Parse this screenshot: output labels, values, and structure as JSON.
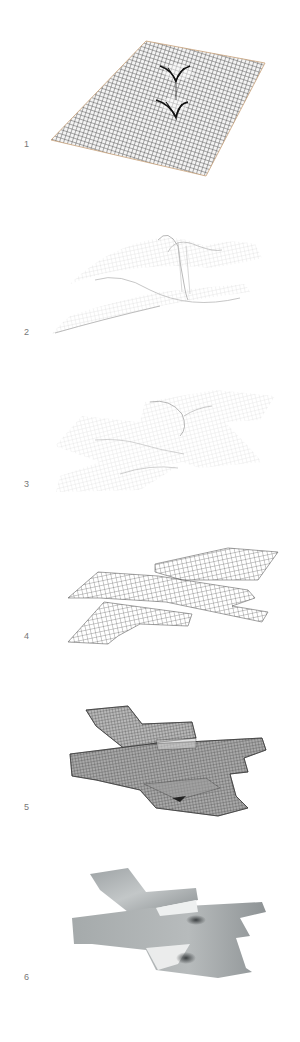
{
  "diagram": {
    "type": "sequential-process",
    "stages": [
      {
        "label": "1",
        "caption": "",
        "style": "dense-wireframe-plane-with-two-pinched-dimples"
      },
      {
        "label": "2",
        "caption": "",
        "style": "faint-wireframe-undulating-surface"
      },
      {
        "label": "3",
        "caption": "",
        "style": "faint-wireframe-cross-shaped-surface"
      },
      {
        "label": "4",
        "caption": "",
        "style": "flat-gridded-cross-shaped-plan"
      },
      {
        "label": "5",
        "caption": "",
        "style": "dense-wireframe-layered-cross-form"
      },
      {
        "label": "6",
        "caption": "",
        "style": "shaded-gray-solid-surface"
      }
    ],
    "colors": {
      "background": "#ffffff",
      "label": "#777777",
      "wire_dark": "#2a2a2a",
      "wire_faint": "#c8c8c8",
      "edge_tan": "#c9a27a",
      "shade_light": "#d7dadb",
      "shade_mid": "#a9adaf",
      "shade_dark": "#5c6062"
    }
  }
}
